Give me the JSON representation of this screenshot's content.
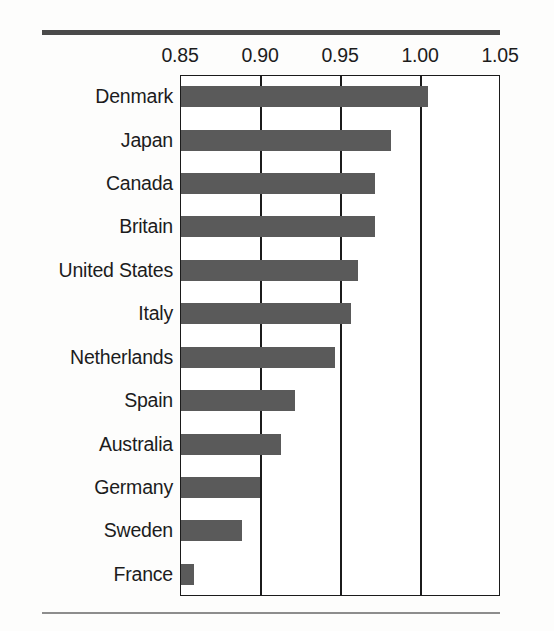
{
  "chart": {
    "type": "bar",
    "orientation": "horizontal",
    "frame": {
      "top_rule": true,
      "bottom_rule": true,
      "plot_border": true,
      "grid": "vertical"
    }
  },
  "chart_data": {
    "type": "bar",
    "title": "",
    "subtitle": "",
    "xlabel": "",
    "ylabel": "",
    "orientation": "horizontal",
    "categories": [
      "Denmark",
      "Japan",
      "Canada",
      "Britain",
      "United States",
      "Italy",
      "Netherlands",
      "Spain",
      "Australia",
      "Germany",
      "Sweden",
      "France"
    ],
    "values": [
      1.005,
      0.982,
      0.972,
      0.972,
      0.961,
      0.957,
      0.947,
      0.922,
      0.913,
      0.9,
      0.889,
      0.859
    ],
    "xlim": [
      0.85,
      1.05
    ],
    "xticks": [
      0.85,
      0.9,
      0.95,
      1.0,
      1.05
    ],
    "xtick_labels": [
      "0.85",
      "0.90",
      "0.95",
      "1.00",
      "1.05"
    ],
    "grid": true,
    "grid_axis": "x",
    "legend": null,
    "legend_position": "none",
    "annotations": [],
    "bar_color": "#5a5a5a",
    "axis_color": "#1b1b1b",
    "background_color": "#ffffff"
  },
  "colors": {
    "bar": "#5a5a5a",
    "axis": "#1b1b1b",
    "rule_top": "#4a4a4a",
    "rule_bottom": "#8d8d8d",
    "text": "#1c1c1c",
    "plot_background": "#ffffff",
    "page_background": "#fdfdfc"
  }
}
